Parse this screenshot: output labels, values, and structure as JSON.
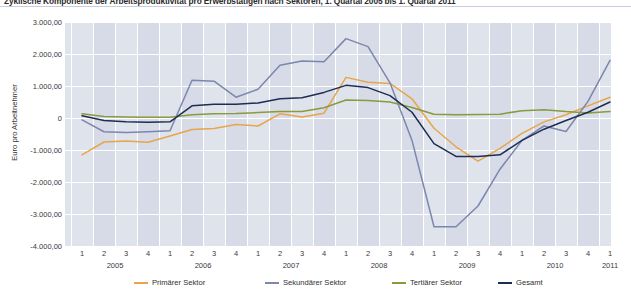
{
  "title": "Zyklische Komponente der Arbeitsproduktivität pro Erwerbstätigen nach Sektoren, 1. Quartal 2005 bis 1. Quartal 2011",
  "axis": {
    "ylabel": "Euro pro Arbeitnehmer",
    "yticks": [
      "3.000,00",
      "2.000,00",
      "1.000,00",
      "0",
      "-1.000,00",
      "-2.000,00",
      "-3.000,00",
      "-4.000,00"
    ],
    "ytick_values": [
      3000,
      2000,
      1000,
      0,
      -1000,
      -2000,
      -3000,
      -4000
    ],
    "ylim": [
      -4000,
      3000
    ],
    "quarters": [
      "1",
      "2",
      "3",
      "4",
      "1",
      "2",
      "3",
      "4",
      "1",
      "2",
      "3",
      "4",
      "1",
      "2",
      "3",
      "4",
      "1",
      "2",
      "3",
      "4",
      "1",
      "2",
      "3",
      "4",
      "1"
    ],
    "years": [
      "2005",
      "2006",
      "2007",
      "2008",
      "2009",
      "2010",
      "2011"
    ]
  },
  "legend": [
    {
      "label": "Primärer Sektor",
      "color": "#e8a54b"
    },
    {
      "label": "Sekundärer Sektor",
      "color": "#7d86ad"
    },
    {
      "label": "Tertiärer Sektor",
      "color": "#8a9a3c"
    },
    {
      "label": "Gesamt",
      "color": "#1d2e52"
    }
  ],
  "chart_data": {
    "type": "line",
    "title": "Zyklische Komponente der Arbeitsproduktivität pro Erwerbstätigen nach Sektoren, 1. Quartal 2005 bis 1. Quartal 2011",
    "xlabel": "",
    "ylabel": "Euro pro Arbeitnehmer",
    "ylim": [
      -4000,
      3000
    ],
    "grid": true,
    "legend_position": "bottom",
    "categories": [
      "2005 Q1",
      "2005 Q2",
      "2005 Q3",
      "2005 Q4",
      "2006 Q1",
      "2006 Q2",
      "2006 Q3",
      "2006 Q4",
      "2007 Q1",
      "2007 Q2",
      "2007 Q3",
      "2007 Q4",
      "2008 Q1",
      "2008 Q2",
      "2008 Q3",
      "2008 Q4",
      "2009 Q1",
      "2009 Q2",
      "2009 Q3",
      "2009 Q4",
      "2010 Q1",
      "2010 Q2",
      "2010 Q3",
      "2010 Q4",
      "2011 Q1"
    ],
    "series": [
      {
        "name": "Primärer Sektor",
        "color": "#e8a54b",
        "values": [
          -1150,
          -750,
          -720,
          -760,
          -560,
          -360,
          -330,
          -200,
          -250,
          130,
          30,
          150,
          1270,
          1120,
          1080,
          600,
          -320,
          -900,
          -1350,
          -950,
          -480,
          -120,
          100,
          380,
          650
        ]
      },
      {
        "name": "Sekundärer Sektor",
        "color": "#7d86ad",
        "values": [
          -60,
          -430,
          -450,
          -430,
          -400,
          1180,
          1150,
          650,
          900,
          1650,
          1780,
          1760,
          2480,
          2230,
          1100,
          -700,
          -3400,
          -3400,
          -2750,
          -1600,
          -700,
          -250,
          -420,
          520,
          1800
        ]
      },
      {
        "name": "Tertiärer Sektor",
        "color": "#8a9a3c",
        "values": [
          130,
          50,
          30,
          20,
          20,
          100,
          130,
          140,
          170,
          200,
          200,
          320,
          560,
          550,
          500,
          330,
          120,
          100,
          110,
          120,
          230,
          260,
          200,
          160,
          200
        ]
      },
      {
        "name": "Gesamt",
        "color": "#1d2e52",
        "values": [
          70,
          -80,
          -120,
          -130,
          -120,
          380,
          430,
          430,
          470,
          600,
          630,
          800,
          1020,
          950,
          700,
          180,
          -800,
          -1200,
          -1200,
          -1150,
          -700,
          -350,
          -80,
          180,
          500
        ]
      }
    ]
  }
}
